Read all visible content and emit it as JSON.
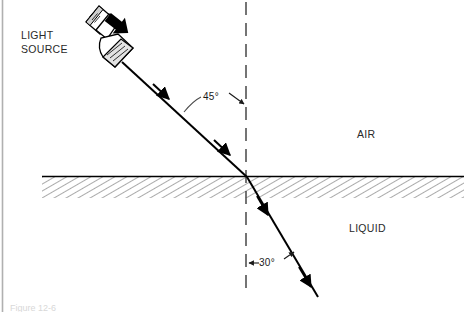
{
  "figure": {
    "caption": "Figure 12-6",
    "labels": {
      "light_source_line1": "LIGHT",
      "light_source_line2": "SOURCE",
      "medium_upper": "AIR",
      "medium_lower": "LIQUID",
      "incident_angle": "45°",
      "refracted_angle": "30°"
    },
    "colors": {
      "ink": "#000000",
      "text": "#2a2a2a",
      "hatch": "#555555",
      "border": "#b0b0b0",
      "background": "#ffffff"
    },
    "geometry": {
      "interface_y": 177,
      "interface_x_start": 42,
      "interface_x_end": 464,
      "hatch_band_height": 21,
      "normal_x": 246,
      "normal_y_top": 2,
      "normal_y_bottom": 296,
      "incidence_point_x": 247,
      "incidence_point_y": 177,
      "incident_ray_start_x": 122,
      "incident_ray_start_y": 62,
      "refracted_ray_end_x": 318,
      "refracted_ray_end_y": 297
    },
    "physics": {
      "angle_of_incidence_deg": 45,
      "angle_of_refraction_deg": 30,
      "upper_medium": "AIR",
      "lower_medium": "LIQUID"
    }
  }
}
